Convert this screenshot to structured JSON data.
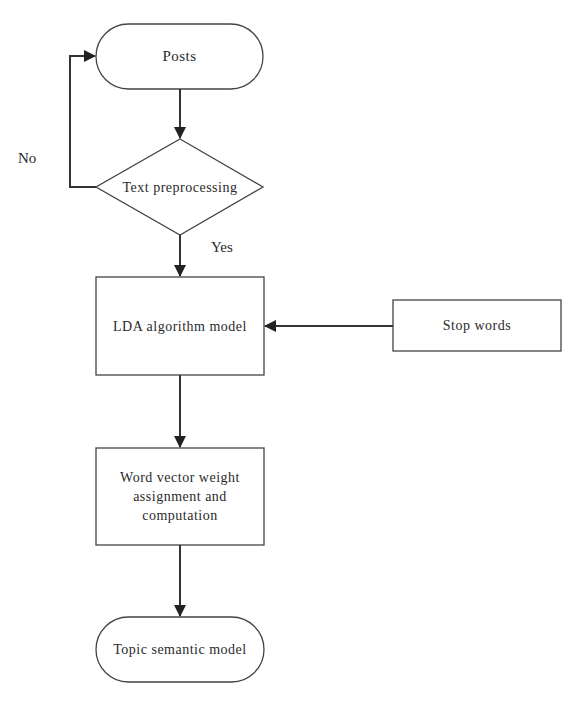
{
  "diagram": {
    "type": "flowchart",
    "nodes": [
      {
        "id": "posts",
        "shape": "terminal",
        "label": "Posts"
      },
      {
        "id": "text_preprocessing",
        "shape": "decision",
        "label": "Text preprocessing"
      },
      {
        "id": "lda",
        "shape": "process",
        "label": "LDA algorithm model"
      },
      {
        "id": "stop_words",
        "shape": "process",
        "label": "Stop words"
      },
      {
        "id": "word_vector",
        "shape": "process",
        "label": "Word vector weight assignment and computation"
      },
      {
        "id": "topic_model",
        "shape": "terminal",
        "label": "Topic semantic model"
      }
    ],
    "edges": [
      {
        "from": "posts",
        "to": "text_preprocessing",
        "label": ""
      },
      {
        "from": "text_preprocessing",
        "to": "posts",
        "label": "No"
      },
      {
        "from": "text_preprocessing",
        "to": "lda",
        "label": "Yes"
      },
      {
        "from": "stop_words",
        "to": "lda",
        "label": ""
      },
      {
        "from": "lda",
        "to": "word_vector",
        "label": ""
      },
      {
        "from": "word_vector",
        "to": "topic_model",
        "label": ""
      }
    ],
    "edge_labels": {
      "no": "No",
      "yes": "Yes"
    },
    "colors": {
      "stroke": "#333333",
      "background": "#ffffff",
      "text": "#2a2a2a"
    }
  }
}
